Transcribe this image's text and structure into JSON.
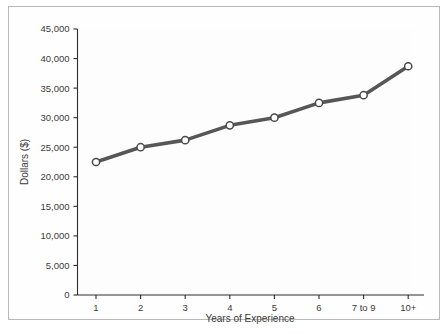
{
  "chart_data": {
    "type": "line",
    "title": "",
    "xlabel": "Years of Experience",
    "ylabel": "Dollars ($)",
    "categories": [
      "1",
      "2",
      "3",
      "4",
      "5",
      "6",
      "7 to 9",
      "10+"
    ],
    "values": [
      22500,
      25000,
      26200,
      28700,
      30000,
      32500,
      33800,
      38700
    ],
    "series": [
      {
        "name": "Dollars ($)",
        "values": [
          22500,
          25000,
          26200,
          28700,
          30000,
          32500,
          33800,
          38700
        ]
      }
    ],
    "ylim": [
      0,
      45000
    ],
    "ytick_labels": [
      "0",
      "5,000",
      "10,000",
      "15,000",
      "20,000",
      "25,000",
      "30,000",
      "35,000",
      "40,000",
      "45,000"
    ],
    "ytick_values": [
      0,
      5000,
      10000,
      15000,
      20000,
      25000,
      30000,
      35000,
      40000,
      45000
    ],
    "grid": false,
    "legend": "none",
    "line_color": "#575757",
    "marker_fill": "#ffffff",
    "marker_edge": "#4a4a4a",
    "axis_color": "#2d2d2d",
    "text_color": "#3b3b3b",
    "plot_background": "#fdfdfd",
    "frame_color": "#b9b9b9"
  }
}
